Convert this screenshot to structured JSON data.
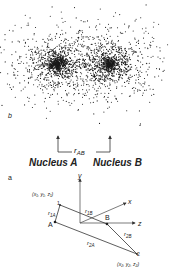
{
  "panel_b": {
    "label": "b",
    "nucleus_a_label": "Nucleus A",
    "nucleus_b_label": "Nucleus B",
    "distance_label_main": "r",
    "distance_label_sub": "AB",
    "dot_color": "#1a1a1a",
    "nucleus_a_center": [
      57,
      64
    ],
    "nucleus_b_center": [
      110,
      64
    ]
  },
  "panel_a": {
    "label": "a",
    "axes": {
      "x": "x",
      "y": "y",
      "z": "z"
    },
    "point_a_label": "A",
    "point_b_label": "B",
    "electron_1_label": "1",
    "electron_2_label": "2",
    "coords_1": "(x₁, y₁, z₁)",
    "coords_2": "(x₂, y₂, z₂)",
    "r1a": {
      "main": "r",
      "sub": "1A"
    },
    "r1b": {
      "main": "r",
      "sub": "1B"
    },
    "r2a": {
      "main": "r",
      "sub": "2A"
    },
    "r2b": {
      "main": "r",
      "sub": "2B"
    }
  }
}
